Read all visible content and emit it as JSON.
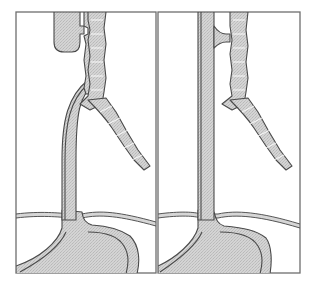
{
  "figure": {
    "type": "anatomical-diagram",
    "panel_count": 2,
    "panels": [
      {
        "id": "left",
        "description": "Esophageal atresia with proximal blind pouch and distal tracheoesophageal fistula",
        "structures": [
          "upper-esophageal-pouch",
          "trachea",
          "bronchi",
          "distal-esophagus-fistula",
          "diaphragm",
          "stomach"
        ]
      },
      {
        "id": "right",
        "description": "H-type tracheoesophageal fistula with continuous esophagus",
        "structures": [
          "esophagus",
          "h-type-fistula",
          "trachea",
          "bronchi",
          "diaphragm",
          "stomach"
        ]
      }
    ]
  },
  "colors": {
    "frame": "#6e6e6e",
    "outline": "#4a4a4a",
    "fill": "#cfcfcf",
    "background": "#ffffff"
  }
}
